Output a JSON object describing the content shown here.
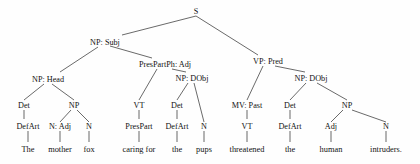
{
  "diagram": {
    "sentence": "The mother fox caring for the pups threatened the human intruders.",
    "ink_color": "#111111",
    "line_color": "#2a2a2a",
    "background_color": "#fefefe"
  },
  "nodes": {
    "root": "S",
    "np_subj": "NP: Subj",
    "vp_pred": "VP: Pred",
    "np_head": "NP: Head",
    "prespartph_adj": "PresPartPh: Adj",
    "np_dobj_1": "NP: DObj",
    "np_dobj_2": "NP: DObj",
    "det_1": "Det",
    "np_1": "NP",
    "vt_1": "VT",
    "det_2": "Det",
    "mv_past": "MV: Past",
    "det_3": "Det",
    "np_2": "NP",
    "defart_1": "DefArt",
    "n_adj": "N: Adj",
    "n_1": "N",
    "prespart": "PresPart",
    "defart_2": "DefArt",
    "n_2": "N",
    "vt_2": "VT",
    "defart_3": "DefArt",
    "adj_1": "Adj",
    "n_3": "N"
  },
  "leaves": {
    "word_1": "The",
    "word_2": "mother",
    "word_3": "fox",
    "word_4": "caring for",
    "word_5": "the",
    "word_6": "pups",
    "word_7": "threatened",
    "word_8": "the",
    "word_9": "human",
    "word_10": "intruders."
  }
}
